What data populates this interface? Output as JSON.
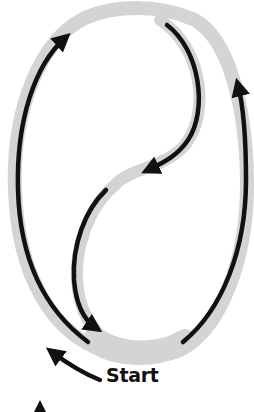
{
  "diagram": {
    "type": "path-route",
    "labels": {
      "start": "Start"
    },
    "colors": {
      "track": "#d4d4d4",
      "arrow": "#111111",
      "background": "#ffffff"
    },
    "segments": [
      {
        "id": "left-side",
        "direction": "up"
      },
      {
        "id": "top-inner-curve",
        "direction": "down-left"
      },
      {
        "id": "middle-inner-curve",
        "direction": "down"
      },
      {
        "id": "right-side",
        "direction": "up"
      },
      {
        "id": "start-pointer",
        "direction": "up-left"
      }
    ]
  }
}
